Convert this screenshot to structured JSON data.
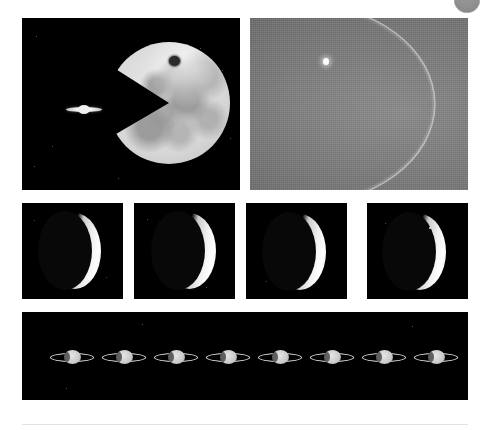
{
  "page": {
    "background_color": "#ffffff",
    "width": 489,
    "height": 430
  },
  "corner_mark": {
    "name": "grey-disc",
    "color": "#8f8f8f",
    "clipped": "top"
  },
  "figure": {
    "layout": "three-row image plate grid",
    "rows": [
      {
        "name": "top-row",
        "plates": [
          {
            "id": "moon-saturn",
            "background": "#000000",
            "subjects": [
              "moon",
              "saturn"
            ],
            "description": "Bright gibbous Moon with a wedge bitten out of its lower-left limb, with tiny ringed Saturn to its left on a black sky",
            "moon": {
              "tone": "#d7d7d7",
              "crater_marks": 9,
              "dark_crater": "#2b2b2b"
            },
            "saturn": {
              "disc_color": "#efefef",
              "ring_color": "#f2f2f2"
            },
            "stars": 7
          },
          {
            "id": "venus-daylight",
            "background": "#777777",
            "subjects": [
              "venus",
              "bright-point"
            ],
            "description": "Thin crescent limb arcing across a grainy grey daylight sky with a brilliant white point on the upper limb",
            "sky_color": "#7d7d7d",
            "limb_color": "#e8e8e8",
            "point_color": "#ffffff"
          }
        ]
      },
      {
        "name": "middle-row",
        "plate_count": 4,
        "plates": [
          {
            "id": "crescent-1",
            "background": "#080808",
            "subject": "crescent",
            "description": "Thin crescent planet, horns up-down, illuminated on the right limb",
            "speck_count": 2
          },
          {
            "id": "crescent-2",
            "background": "#080808",
            "subject": "crescent",
            "description": "Thin crescent planet, slightly wider illuminated right limb",
            "speck_count": 2
          },
          {
            "id": "crescent-3",
            "background": "#080808",
            "subject": "crescent",
            "description": "Thin crescent planet on black sky",
            "speck_count": 1
          },
          {
            "id": "crescent-4",
            "background": "#080808",
            "subject": "crescent",
            "description": "Thin crescent planet with a small bright knot on the upper horn",
            "speck_count": 2
          }
        ]
      },
      {
        "name": "bottom-row",
        "plates": [
          {
            "id": "saturn-sequence",
            "background": "#000000",
            "subject": "saturn-sequence",
            "description": "Eight successive images of ringed Saturn in a horizontal row on a black sky",
            "frame_count": 8,
            "disc_color": "#c9c9c9",
            "ring_color": "#ebebeb"
          }
        ]
      }
    ]
  },
  "footer": {
    "divider_color": "#e3e3e3"
  }
}
